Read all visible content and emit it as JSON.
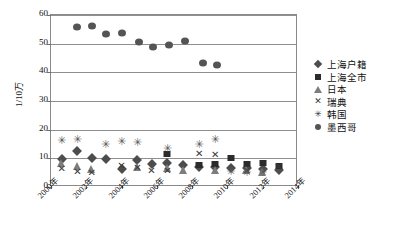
{
  "chart_data": {
    "type": "scatter",
    "title": "",
    "xlabel": "",
    "ylabel": "1/10万",
    "ylim": [
      0,
      60
    ],
    "yticks": [
      0,
      10,
      20,
      30,
      40,
      50,
      60
    ],
    "xlim": [
      2000,
      2014
    ],
    "xticks": [
      "2000年",
      "2002年",
      "2004年",
      "2006年",
      "2008年",
      "2010年",
      "2012年",
      "2014年"
    ],
    "grid": true,
    "legend_position": "right",
    "series": [
      {
        "name": "上海户籍",
        "marker": "diamond",
        "color": "#4d4d4d",
        "points": [
          {
            "x": 2000.6,
            "y": 9.6
          },
          {
            "x": 2001.5,
            "y": 12.4
          },
          {
            "x": 2002.3,
            "y": 10.2
          },
          {
            "x": 2003.1,
            "y": 9.8
          },
          {
            "x": 2004.0,
            "y": 6.2
          },
          {
            "x": 2004.9,
            "y": 9.4
          },
          {
            "x": 2005.7,
            "y": 8.0
          },
          {
            "x": 2006.6,
            "y": 8.4
          },
          {
            "x": 2007.5,
            "y": 7.6
          },
          {
            "x": 2008.4,
            "y": 7.1
          },
          {
            "x": 2009.3,
            "y": 6.9
          },
          {
            "x": 2010.2,
            "y": 6.6
          },
          {
            "x": 2011.1,
            "y": 6.8
          },
          {
            "x": 2012.0,
            "y": 6.2
          },
          {
            "x": 2012.9,
            "y": 5.9
          }
        ]
      },
      {
        "name": "上海全市",
        "marker": "square",
        "color": "#2b2b2b",
        "points": [
          {
            "x": 2006.6,
            "y": 11.6
          },
          {
            "x": 2008.4,
            "y": 7.8
          },
          {
            "x": 2009.3,
            "y": 8.0
          },
          {
            "x": 2010.2,
            "y": 10.2
          },
          {
            "x": 2011.1,
            "y": 8.1
          },
          {
            "x": 2012.0,
            "y": 8.2
          },
          {
            "x": 2012.9,
            "y": 7.4
          }
        ]
      },
      {
        "name": "日本",
        "marker": "triangle",
        "color": "#7d7d7d",
        "points": [
          {
            "x": 2000.6,
            "y": 8.2
          },
          {
            "x": 2001.5,
            "y": 7.4
          },
          {
            "x": 2002.3,
            "y": 6.4
          },
          {
            "x": 2004.9,
            "y": 7.0
          },
          {
            "x": 2006.6,
            "y": 6.6
          },
          {
            "x": 2007.5,
            "y": 6.0
          },
          {
            "x": 2009.3,
            "y": 6.0
          },
          {
            "x": 2011.1,
            "y": 5.8
          },
          {
            "x": 2012.0,
            "y": 5.4
          }
        ]
      },
      {
        "name": "瑞典",
        "marker": "cross",
        "color": "#3a3a3a",
        "points": [
          {
            "x": 2000.6,
            "y": 5.8
          },
          {
            "x": 2001.5,
            "y": 4.8
          },
          {
            "x": 2002.3,
            "y": 4.7
          },
          {
            "x": 2004.0,
            "y": 7.0
          },
          {
            "x": 2004.9,
            "y": 6.3
          },
          {
            "x": 2005.7,
            "y": 5.4
          },
          {
            "x": 2006.6,
            "y": 5.3
          },
          {
            "x": 2008.4,
            "y": 11.2
          },
          {
            "x": 2009.3,
            "y": 10.8
          },
          {
            "x": 2011.1,
            "y": 5.2
          },
          {
            "x": 2012.9,
            "y": 6.8
          }
        ]
      },
      {
        "name": "韩国",
        "marker": "star",
        "color": "#5a5a5a",
        "points": [
          {
            "x": 2000.6,
            "y": 15.6
          },
          {
            "x": 2001.5,
            "y": 16.2
          },
          {
            "x": 2003.1,
            "y": 14.4
          },
          {
            "x": 2004.0,
            "y": 15.2
          },
          {
            "x": 2004.9,
            "y": 15.0
          },
          {
            "x": 2006.6,
            "y": 13.0
          },
          {
            "x": 2008.4,
            "y": 14.4
          },
          {
            "x": 2009.3,
            "y": 16.2
          },
          {
            "x": 2010.2,
            "y": 5.0
          },
          {
            "x": 2011.1,
            "y": 4.6
          },
          {
            "x": 2012.0,
            "y": 4.4
          }
        ]
      },
      {
        "name": "墨西哥",
        "marker": "circle",
        "color": "#545454",
        "points": [
          {
            "x": 2001.5,
            "y": 55.8
          },
          {
            "x": 2002.3,
            "y": 56.2
          },
          {
            "x": 2003.1,
            "y": 53.4
          },
          {
            "x": 2004.0,
            "y": 53.8
          },
          {
            "x": 2005.0,
            "y": 50.6
          },
          {
            "x": 2005.8,
            "y": 48.8
          },
          {
            "x": 2006.7,
            "y": 49.4
          },
          {
            "x": 2007.6,
            "y": 51.0
          },
          {
            "x": 2008.6,
            "y": 43.4
          },
          {
            "x": 2009.4,
            "y": 42.4
          }
        ]
      }
    ]
  },
  "legend": {
    "items": [
      {
        "label": "上海户籍",
        "marker": "diamond"
      },
      {
        "label": "上海全市",
        "marker": "square"
      },
      {
        "label": "日本",
        "marker": "triangle"
      },
      {
        "label": "瑞典",
        "marker": "cross"
      },
      {
        "label": "韩国",
        "marker": "star"
      },
      {
        "label": "墨西哥",
        "marker": "circle"
      }
    ]
  },
  "glyphs": {
    "cross": "✕",
    "star": "✳"
  }
}
